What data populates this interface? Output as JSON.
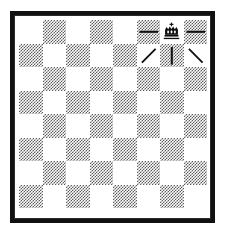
{
  "diagram": {
    "board": {
      "files": 8,
      "ranks": 8,
      "light_color": "#ffffff",
      "dark_color": "#5d5d5d",
      "border_color": "#111111",
      "orientation": "white-bottom"
    },
    "squares": [
      [
        "light",
        "dark",
        "light",
        "dark",
        "light",
        "dark",
        "light",
        "dark"
      ],
      [
        "dark",
        "light",
        "dark",
        "light",
        "dark",
        "light",
        "dark",
        "light"
      ],
      [
        "light",
        "dark",
        "light",
        "dark",
        "light",
        "dark",
        "light",
        "dark"
      ],
      [
        "dark",
        "light",
        "dark",
        "light",
        "dark",
        "light",
        "dark",
        "light"
      ],
      [
        "light",
        "dark",
        "light",
        "dark",
        "light",
        "dark",
        "light",
        "dark"
      ],
      [
        "dark",
        "light",
        "dark",
        "light",
        "dark",
        "light",
        "dark",
        "light"
      ],
      [
        "light",
        "dark",
        "light",
        "dark",
        "light",
        "dark",
        "light",
        "dark"
      ],
      [
        "dark",
        "light",
        "dark",
        "light",
        "dark",
        "light",
        "dark",
        "light"
      ]
    ],
    "pieces": [
      {
        "name": "king",
        "color": "black",
        "glyph": "crown-with-cross",
        "row": 0,
        "col": 6
      }
    ],
    "marks": [
      {
        "name": "horizontal-dash-left",
        "symbol": "—",
        "row": 0,
        "col": 5
      },
      {
        "name": "horizontal-dash-right",
        "symbol": "—",
        "row": 0,
        "col": 7
      },
      {
        "name": "diagonal-slash",
        "symbol": "/",
        "row": 1,
        "col": 5
      },
      {
        "name": "vertical-bar",
        "symbol": "|",
        "row": 1,
        "col": 6
      },
      {
        "name": "diagonal-backslash",
        "symbol": "\\",
        "row": 1,
        "col": 7
      }
    ]
  }
}
